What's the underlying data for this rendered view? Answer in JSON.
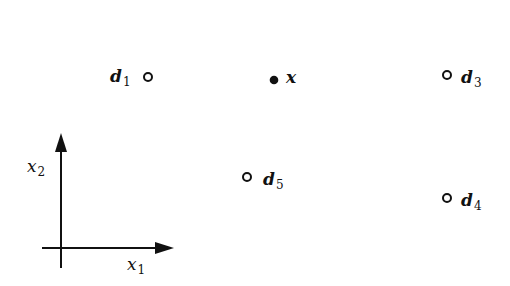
{
  "diagram": {
    "points": [
      {
        "id": "d1",
        "name": "d",
        "sub": "1",
        "type": "hollow",
        "cx": 148,
        "cy": 77,
        "label_side": "left"
      },
      {
        "id": "x",
        "name": "x",
        "sub": "",
        "type": "filled",
        "cx": 274,
        "cy": 80,
        "label_side": "right"
      },
      {
        "id": "d3",
        "name": "d",
        "sub": "3",
        "type": "hollow",
        "cx": 447,
        "cy": 75,
        "label_side": "right"
      },
      {
        "id": "d5",
        "name": "d",
        "sub": "5",
        "type": "hollow",
        "cx": 247,
        "cy": 177,
        "label_side": "right"
      },
      {
        "id": "d4",
        "name": "d",
        "sub": "4",
        "type": "hollow",
        "cx": 447,
        "cy": 198,
        "label_side": "right"
      }
    ],
    "axes": {
      "x_axis": {
        "name": "x",
        "sub": "1"
      },
      "y_axis": {
        "name": "x",
        "sub": "2"
      }
    },
    "colors": {
      "stroke": "#111111",
      "background": "#ffffff"
    }
  }
}
